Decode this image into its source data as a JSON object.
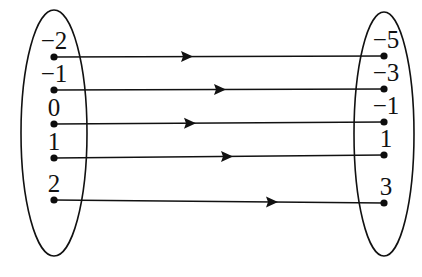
{
  "diagram": {
    "type": "arrow-mapping-diagram",
    "background_color": "#ffffff",
    "stroke_color": "#111111",
    "domain_set": {
      "name": "domain",
      "shape": "ellipse",
      "center_x": 54,
      "center_y": 133,
      "radius_x": 33,
      "radius_y": 123,
      "elements": [
        {
          "label": "−2",
          "x": 54,
          "y": 57,
          "label_x": 54,
          "label_y": 49
        },
        {
          "label": "−1",
          "x": 54,
          "y": 90,
          "label_x": 54,
          "label_y": 82
        },
        {
          "label": "0",
          "x": 54,
          "y": 124,
          "label_x": 54,
          "label_y": 116
        },
        {
          "label": "1",
          "x": 54,
          "y": 158,
          "label_x": 54,
          "label_y": 150
        },
        {
          "label": "2",
          "x": 54,
          "y": 200,
          "label_x": 54,
          "label_y": 192
        }
      ]
    },
    "codomain_set": {
      "name": "codomain",
      "shape": "ellipse",
      "center_x": 384,
      "center_y": 134,
      "radius_x": 30,
      "radius_y": 122,
      "elements": [
        {
          "label": "−5",
          "x": 384,
          "y": 56,
          "label_x": 386,
          "label_y": 48
        },
        {
          "label": "−3",
          "x": 384,
          "y": 89,
          "label_x": 386,
          "label_y": 81
        },
        {
          "label": "−1",
          "x": 384,
          "y": 122,
          "label_x": 386,
          "label_y": 114
        },
        {
          "label": "1",
          "x": 384,
          "y": 155,
          "label_x": 386,
          "label_y": 147
        },
        {
          "label": "3",
          "x": 384,
          "y": 203,
          "label_x": 386,
          "label_y": 195
        }
      ]
    },
    "arrows": [
      {
        "from": "−2",
        "to": "−5",
        "x1": 54,
        "y1": 57,
        "x2": 384,
        "y2": 56,
        "head_x": 185
      },
      {
        "from": "−1",
        "to": "−3",
        "x1": 54,
        "y1": 90,
        "x2": 384,
        "y2": 89,
        "head_x": 218
      },
      {
        "from": "0",
        "to": "−1",
        "x1": 54,
        "y1": 124,
        "x2": 384,
        "y2": 122,
        "head_x": 188
      },
      {
        "from": "1",
        "to": "1",
        "x1": 54,
        "y1": 158,
        "x2": 384,
        "y2": 155,
        "head_x": 225
      },
      {
        "from": "2",
        "to": "3",
        "x1": 54,
        "y1": 200,
        "x2": 384,
        "y2": 203,
        "head_x": 270
      }
    ]
  }
}
